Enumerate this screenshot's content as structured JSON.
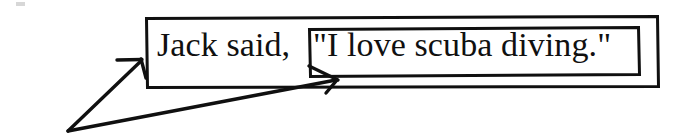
{
  "document": {
    "type": "scanned-grammar-diagram",
    "background_color": "#ffffff",
    "ink_color": "#101010",
    "width": 678,
    "height": 136
  },
  "sentence": {
    "full_text": "Jack said, \"I love scuba diving.\"",
    "attribution_clause": "Jack said, ",
    "quoted_speech": "\"I love scuba diving.\""
  },
  "boxes": {
    "outer": {
      "label": "outer-sentence-box",
      "x": 145,
      "y": 17,
      "width": 514,
      "height": 71,
      "stroke": "#101010",
      "stroke_width": 3
    },
    "inner": {
      "label": "inner-quotation-box",
      "x": 308,
      "y": 28,
      "width": 331,
      "height": 48,
      "stroke": "#101010",
      "stroke_width": 3
    }
  },
  "annotations": {
    "origin": {
      "x": 68,
      "y": 131
    },
    "arrows": [
      {
        "name": "arrow-to-sentence-box",
        "from_x": 68,
        "from_y": 131,
        "to_x": 142,
        "to_y": 60,
        "target": "outer-sentence-box"
      },
      {
        "name": "arrow-to-quotation-box",
        "from_x": 68,
        "from_y": 131,
        "to_x": 337,
        "to_y": 80,
        "target": "inner-quotation-box"
      }
    ]
  }
}
